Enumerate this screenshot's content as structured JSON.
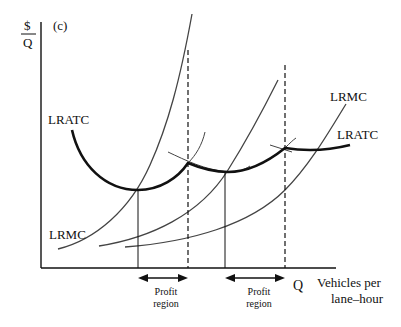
{
  "figure": {
    "panel_label": "(c)",
    "y_axis_label_top": "$",
    "y_axis_label_bottom": "Q",
    "x_axis_symbol": "Q",
    "x_axis_label_line1": "Vehicles per",
    "x_axis_label_line2": "lane–hour",
    "curve_labels": {
      "lratc_left": "LRATC",
      "lrmc_left": "LRMC",
      "lrmc_right": "LRMC",
      "lratc_right": "LRATC"
    },
    "profit_regions": [
      {
        "line1": "Profit",
        "line2": "region"
      },
      {
        "line1": "Profit",
        "line2": "region"
      }
    ]
  },
  "colors": {
    "ink": "#111111",
    "thin_curve": "#444444"
  }
}
